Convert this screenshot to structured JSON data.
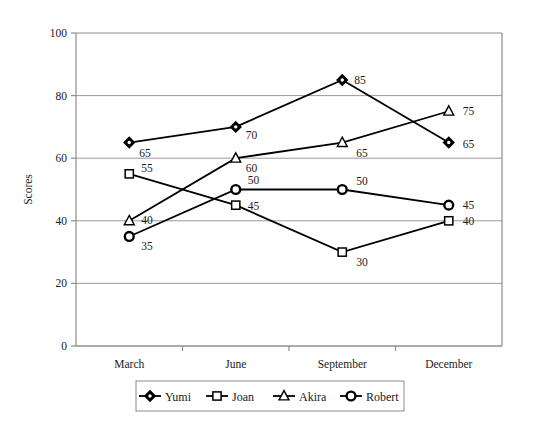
{
  "chart_data": {
    "type": "line",
    "title": "",
    "xlabel": "",
    "ylabel": "Scores",
    "categories": [
      "March",
      "June",
      "September",
      "December"
    ],
    "ylim": [
      0,
      100
    ],
    "yticks": [
      0,
      20,
      40,
      60,
      80,
      100
    ],
    "grid": true,
    "legend_position": "bottom",
    "series": [
      {
        "name": "Yumi",
        "marker": "diamond",
        "color": "#000000",
        "values": [
          65,
          70,
          85,
          65
        ],
        "labels": [
          "65",
          "70",
          "85",
          "65"
        ]
      },
      {
        "name": "Joan",
        "marker": "square",
        "color": "#000000",
        "values": [
          55,
          45,
          30,
          40
        ],
        "labels": [
          "55",
          "45",
          "30",
          "40"
        ]
      },
      {
        "name": "Akira",
        "marker": "triangle",
        "color": "#000000",
        "values": [
          40,
          60,
          65,
          75
        ],
        "labels": [
          "40",
          "60",
          "65",
          "75"
        ]
      },
      {
        "name": "Robert",
        "marker": "circle",
        "color": "#000000",
        "values": [
          35,
          50,
          50,
          45
        ],
        "labels": [
          "35",
          "50",
          "50",
          "45"
        ]
      }
    ]
  },
  "axis": {
    "y_title": "Scores",
    "y_tick_labels": [
      "100",
      "80",
      "60",
      "40",
      "20",
      "0"
    ],
    "x_tick_labels": [
      "March",
      "June",
      "September",
      "December"
    ]
  },
  "legend": {
    "entries": [
      {
        "label": "Yumi",
        "marker": "diamond-icon"
      },
      {
        "label": "Joan",
        "marker": "square-icon"
      },
      {
        "label": "Akira",
        "marker": "triangle-icon"
      },
      {
        "label": "Robert",
        "marker": "circle-icon"
      }
    ]
  },
  "style": {
    "line_color": "#000000",
    "grid_color": "#9a9a9a",
    "frame_color": "#8c8c8c",
    "background": "#ffffff",
    "marker_fill": "#ffffff"
  }
}
